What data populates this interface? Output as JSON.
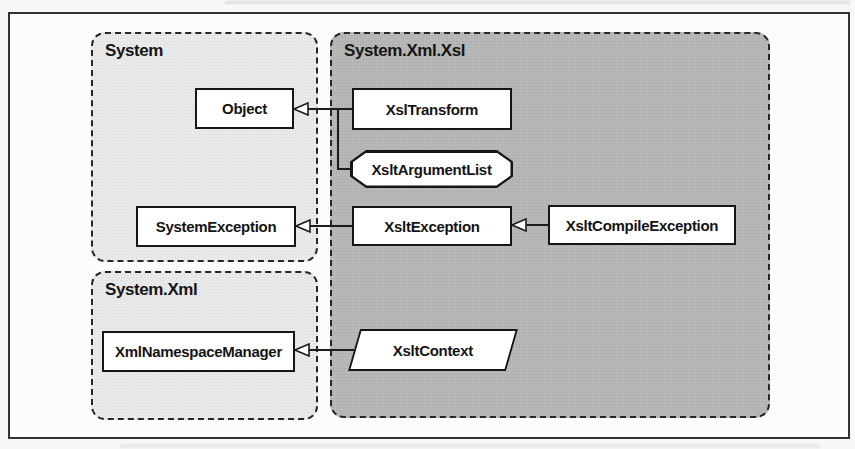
{
  "figure": {
    "kind": "class-hierarchy-diagram",
    "namespaces": [
      {
        "label": "System"
      },
      {
        "label": "System.Xml.Xsl"
      },
      {
        "label": "System.Xml"
      }
    ],
    "nodes": [
      {
        "label": "Object",
        "shape": "rectangle",
        "namespace": "System"
      },
      {
        "label": "XslTransform",
        "shape": "rectangle",
        "namespace": "System.Xml.Xsl"
      },
      {
        "label": "XsltArgumentList",
        "shape": "octagon",
        "namespace": "System.Xml.Xsl"
      },
      {
        "label": "SystemException",
        "shape": "rectangle",
        "namespace": "System"
      },
      {
        "label": "XsltException",
        "shape": "rectangle",
        "namespace": "System.Xml.Xsl"
      },
      {
        "label": "XsltCompileException",
        "shape": "rectangle",
        "namespace": "System.Xml.Xsl"
      },
      {
        "label": "XmlNamespaceManager",
        "shape": "rectangle",
        "namespace": "System.Xml"
      },
      {
        "label": "XsltContext",
        "shape": "parallelogram",
        "namespace": "System.Xml.Xsl"
      }
    ],
    "edges": [
      {
        "from": "XslTransform",
        "to": "Object",
        "relation": "inherits"
      },
      {
        "from": "XsltArgumentList",
        "to": "Object",
        "relation": "inherits"
      },
      {
        "from": "XsltException",
        "to": "SystemException",
        "relation": "inherits"
      },
      {
        "from": "XsltCompileException",
        "to": "XsltException",
        "relation": "inherits"
      },
      {
        "from": "XsltContext",
        "to": "XmlNamespaceManager",
        "relation": "inherits"
      }
    ],
    "colors": {
      "namespace_light_fill": "#e9e9e9",
      "namespace_dark_fill": "#b7b7b7",
      "node_fill": "#ffffff",
      "line": "#1c1c1c",
      "page_background": "#f8f8f7"
    }
  }
}
